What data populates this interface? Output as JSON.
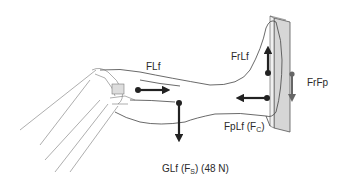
{
  "figure": {
    "labels": {
      "flf": "FLf",
      "frlf": "FrLf",
      "frfp": "FrFp",
      "fplf_main": "FpLf (F",
      "fplf_sub": "C",
      "fplf_close": ")",
      "glf_main": "GLf (F",
      "glf_sub": "S",
      "glf_close": ") (48 N)"
    },
    "forces": [
      {
        "name": "FLf",
        "direction": "right"
      },
      {
        "name": "GLf (Fs) (48 N)",
        "direction": "down"
      },
      {
        "name": "FrLf",
        "direction": "up"
      },
      {
        "name": "FpLf (Fc)",
        "direction": "left"
      },
      {
        "name": "FrFp",
        "direction": "down"
      }
    ],
    "colors": {
      "arrow": "#222222",
      "plate": "#d4d4d4",
      "plate_arrow": "#666666",
      "outline": "#555555"
    }
  }
}
